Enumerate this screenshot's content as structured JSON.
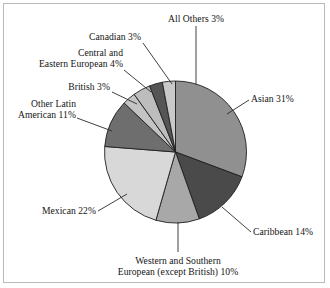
{
  "figure": {
    "border_color": "#b9b9b9",
    "background": "#ffffff"
  },
  "chart_data": {
    "type": "pie",
    "title": "",
    "xlabel": "",
    "ylabel": "",
    "legend_position": "none",
    "grid": false,
    "start_angle_deg": 0,
    "direction": "clockwise",
    "units": "percent",
    "total": 101,
    "categories": [
      "Asian",
      "Caribbean",
      "Western and Southern European (except British)",
      "Mexican",
      "Other Latin American",
      "British",
      "Central and Eastern European",
      "Canadian",
      "All Others"
    ],
    "values": [
      31,
      14,
      10,
      22,
      11,
      3,
      4,
      3,
      3
    ],
    "colors": [
      "#909090",
      "#4a4a4a",
      "#a8a8a8",
      "#d8d8d8",
      "#6e6e6e",
      "#c4c4c4",
      "#bdbdbd",
      "#555555",
      "#c9c9c9"
    ],
    "slice_labels": [
      "Asian 31%",
      "Caribbean 14%",
      "Western and Southern European (except British) 10%",
      "Mexican 22%",
      "Other Latin American 11%",
      "British 3%",
      "Central and Eastern European 4%",
      "Canadian 3%",
      "All Others 3%"
    ]
  },
  "labels": {
    "all_others": {
      "line1": "All Others 3%"
    },
    "canadian": {
      "line1": "Canadian 3%"
    },
    "central_eastern_european": {
      "line1": "Central and",
      "line2": "Eastern European 4%"
    },
    "british": {
      "line1": "British 3%"
    },
    "other_latin_american": {
      "line1": "Other Latin",
      "line2": "American 11%"
    },
    "mexican": {
      "line1": "Mexican 22%"
    },
    "western_southern_european": {
      "line1": "Western and Southern",
      "line2": "European (except British) 10%"
    },
    "caribbean": {
      "line1": "Caribbean 14%"
    },
    "asian": {
      "line1": "Asian 31%"
    }
  }
}
